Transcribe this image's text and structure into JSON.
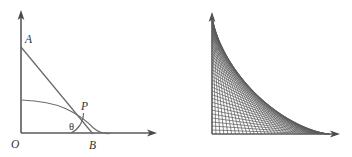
{
  "figure": {
    "background_color": "#ffffff",
    "stroke_color": "#5a5a5a",
    "line_color": "#6a6a6a",
    "family_line_color": "#595959",
    "width": 352,
    "height": 157
  },
  "left_panel": {
    "name": "single-ladder-diagram",
    "origin": {
      "label": "O",
      "x": 21,
      "y": 133
    },
    "y_axis": {
      "x": 21,
      "y_top": 12,
      "y_bottom": 133,
      "arrow": "up"
    },
    "x_axis": {
      "y": 133,
      "x_left": 21,
      "x_right": 157,
      "arrow": "right"
    },
    "points": [
      {
        "label": "A",
        "x": 21,
        "y": 47,
        "label_x": 25,
        "label_y": 43
      },
      {
        "label": "P",
        "x": 76,
        "y": 114,
        "label_x": 81,
        "label_y": 110
      },
      {
        "label": "B",
        "x": 93,
        "y": 133,
        "label_x": 91,
        "label_y": 148
      }
    ],
    "angle": {
      "label": "θ",
      "vertex": "B",
      "label_x": 73,
      "label_y": 131,
      "arc_radius": 22
    },
    "segment": {
      "from": "A",
      "to": "B",
      "description": "ladder AB"
    },
    "curve": {
      "description": "astroid envelope arc",
      "start_x": 21,
      "start_y": 100,
      "end_x": 110,
      "end_y": 133
    }
  },
  "right_panel": {
    "name": "ladder-family-envelope",
    "origin": {
      "x": 212,
      "y": 134
    },
    "y_axis": {
      "x": 212,
      "y_top": 14,
      "y_bottom": 134,
      "arrow": "up"
    },
    "x_axis": {
      "y": 134,
      "x_left": 212,
      "x_right": 340,
      "arrow": "right"
    },
    "family": {
      "description": "family of ladder segments of constant length forming astroid envelope",
      "line_count": 46,
      "x_extent": 118,
      "y_extent": 120
    }
  }
}
